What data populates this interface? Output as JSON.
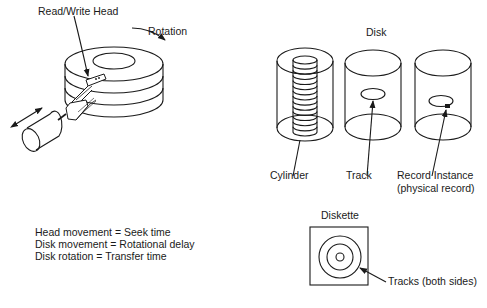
{
  "labels": {
    "read_write_head": "Read/Write Head",
    "rotation": "Rotation",
    "disk_title": "Disk",
    "cylinder": "Cylinder",
    "track": "Track",
    "record_instance_line1": "Record Instance",
    "record_instance_line2": "(physical record)",
    "diskette_title": "Diskette",
    "tracks_both_sides": "Tracks (both sides)"
  },
  "equations": [
    "Head movement = Seek time",
    "Disk movement = Rotational delay",
    "Disk rotation = Transfer time"
  ],
  "colors": {
    "ink": "#1a1a1a",
    "background": "#ffffff"
  }
}
